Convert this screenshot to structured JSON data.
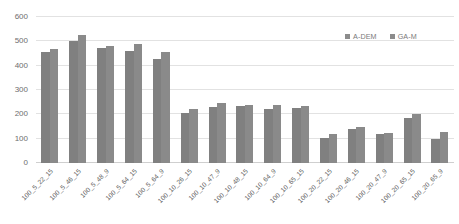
{
  "chart_data": {
    "type": "bar",
    "title": "",
    "subtitle": "",
    "xlabel": "",
    "ylabel": "",
    "ylim": [
      0,
      600
    ],
    "yticks": [
      0,
      100,
      200,
      300,
      400,
      500,
      600
    ],
    "grid": true,
    "legend_position": "top-right",
    "categories": [
      "100_5_22_15",
      "100_5_46_15",
      "100_5_48_9",
      "100_5_64_15",
      "100_5_64_9",
      "100_10_26_15",
      "100_10_47_9",
      "100_10_48_15",
      "100_10_64_9",
      "100_10_65_15",
      "100_20_22_15",
      "100_20_46_15",
      "100_20_47_9",
      "100_20_65_15",
      "100_20_65_9"
    ],
    "series": [
      {
        "name": "A-DEM",
        "color": "#808080",
        "values": [
          455,
          503,
          472,
          460,
          428,
          205,
          232,
          233,
          224,
          228,
          103,
          140,
          118,
          185,
          100
        ]
      },
      {
        "name": "GA-M",
        "color": "#8a8a8a",
        "values": [
          470,
          527,
          482,
          490,
          458,
          223,
          247,
          240,
          240,
          236,
          118,
          147,
          124,
          200,
          128
        ]
      }
    ]
  },
  "legend": {
    "entries": [
      {
        "label": "A-DEM",
        "color": "#8c8c8c"
      },
      {
        "label": "GA-M",
        "color": "#8c8c8c"
      }
    ]
  },
  "axes": {
    "y_tick_labels": [
      "600",
      "500",
      "400",
      "300",
      "200",
      "100",
      "0"
    ]
  },
  "colors": {
    "gridline": "#e2e2e2",
    "axis_text": "#6e6e6e",
    "background": "#ffffff"
  }
}
